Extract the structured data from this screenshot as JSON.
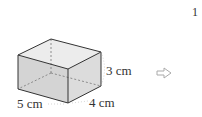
{
  "page_number": "1",
  "figure": {
    "shape": "rectangular-prism",
    "dimensions": {
      "length_label": "5 cm",
      "width_label": "4 cm",
      "height_label": "3 cm"
    },
    "face_color": "#d9d9d9",
    "edge_color": "#333333"
  },
  "arrow_icon": "hollow-right-arrow-icon"
}
